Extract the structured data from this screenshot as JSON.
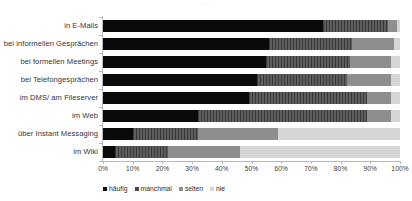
{
  "chart_data": {
    "type": "bar",
    "subtype": "stacked-horizontal-100",
    "title": "",
    "xlabel": "",
    "ylabel": "",
    "xlim": [
      0,
      100
    ],
    "grid": false,
    "legend_position": "bottom-left",
    "axis_tick_suffix": "%",
    "categories": [
      "in E-Mails",
      "bei informellen Gesprächen",
      "bei formellen Meetings",
      "bei Telefongesprächen",
      "im DMS/ am Fileserver",
      "im Web",
      "über Instant Messaging",
      "im Wiki"
    ],
    "xticks": [
      "0%",
      "10%",
      "20%",
      "30%",
      "40%",
      "50%",
      "60%",
      "70%",
      "80%",
      "90%",
      "100%"
    ],
    "xtick_values": [
      0,
      10,
      20,
      30,
      40,
      50,
      60,
      70,
      80,
      90,
      100
    ],
    "series": [
      {
        "name": "häufig",
        "color": "#0a0a0a",
        "values": [
          74,
          56,
          55,
          52,
          49,
          32,
          10,
          4
        ]
      },
      {
        "name": "manchmal",
        "color": "#4a4a4a",
        "values": [
          22,
          28,
          28,
          30,
          40,
          57,
          22,
          18
        ]
      },
      {
        "name": "selten",
        "color": "#8e8e8e",
        "values": [
          3,
          14,
          14,
          15,
          8,
          8,
          27,
          24
        ]
      },
      {
        "name": "nie",
        "color": "#d6d6d6",
        "values": [
          1,
          2,
          3,
          3,
          3,
          3,
          41,
          54
        ]
      }
    ]
  },
  "top_crop": {
    "text": "· ·            ·"
  },
  "legend": {
    "items": [
      {
        "label": "häufig"
      },
      {
        "label": "manchmal"
      },
      {
        "label": "selten"
      },
      {
        "label": "nie"
      }
    ]
  }
}
